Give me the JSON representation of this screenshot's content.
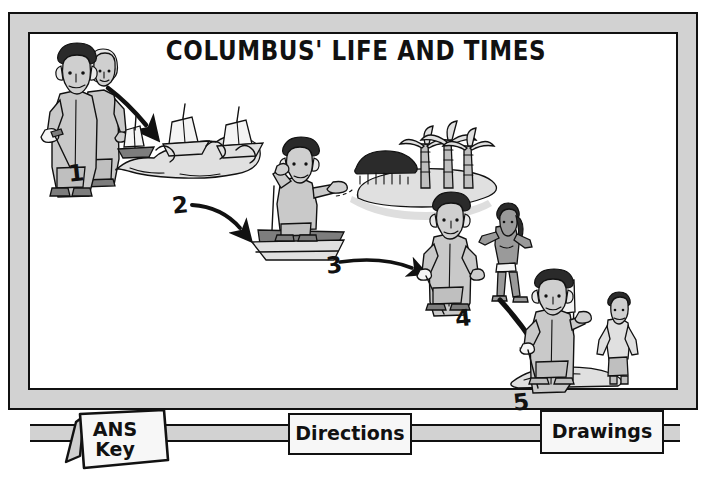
{
  "poster": {
    "title": "COLUMBUS' LIFE AND TIMES",
    "frame_color": "#d2d2d2",
    "ink_color": "#111111",
    "paper_color": "#ffffff"
  },
  "scenes": [
    {
      "number": "1",
      "name": "columbus-with-monarch",
      "description": "Columbus with sword standing beside a monarch"
    },
    {
      "number": "2",
      "name": "three-ships-at-sea",
      "description": "Three sailing ships on ocean waves"
    },
    {
      "number": "3",
      "name": "columbus-sighting-land",
      "description": "Columbus on ship deck pointing toward an island with palm trees"
    },
    {
      "number": "4",
      "name": "columbus-meets-native",
      "description": "Columbus with sword meeting a native islander"
    },
    {
      "number": "5",
      "name": "columbus-plants-flag",
      "description": "Columbus planting a flag on shore beside a native islander"
    }
  ],
  "tabs": [
    {
      "name": "ans-key",
      "label_line1": "ANS",
      "label_line2": "Key"
    },
    {
      "name": "directions",
      "label": "Directions"
    },
    {
      "name": "drawings",
      "label": "Drawings"
    }
  ]
}
